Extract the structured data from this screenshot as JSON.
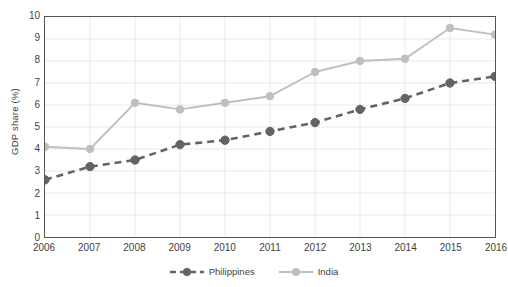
{
  "chart_data": {
    "type": "line",
    "title": "",
    "xlabel": "",
    "ylabel": "GDP share (%)",
    "categories": [
      "2006",
      "2007",
      "2008",
      "2009",
      "2010",
      "2011",
      "2012",
      "2013",
      "2014",
      "2015",
      "2016"
    ],
    "x": [
      2006,
      2007,
      2008,
      2009,
      2010,
      2011,
      2012,
      2013,
      2014,
      2015,
      2016
    ],
    "ylim": [
      0,
      10
    ],
    "yticks": [
      0,
      1,
      2,
      3,
      4,
      5,
      6,
      7,
      8,
      9,
      10
    ],
    "ytick_labels": [
      "0",
      "1",
      "2",
      "3",
      "4",
      "5",
      "6",
      "7",
      "8",
      "9",
      "10"
    ],
    "grid": true,
    "legend_position": "bottom",
    "series": [
      {
        "name": "Philippines",
        "values": [
          2.6,
          3.2,
          3.5,
          4.2,
          4.4,
          4.8,
          5.2,
          5.8,
          6.3,
          7.0,
          7.3
        ],
        "color": "#636363",
        "line_style": "dashed",
        "marker": "circle"
      },
      {
        "name": "India",
        "values": [
          4.1,
          4.0,
          6.1,
          5.8,
          6.1,
          6.4,
          7.5,
          8.0,
          8.1,
          9.5,
          9.2
        ],
        "color": "#bfbfbf",
        "line_style": "solid",
        "marker": "circle"
      }
    ]
  },
  "axis": {
    "y_title": "GDP share (%)"
  },
  "legend": {
    "items": [
      {
        "label": "Philippines"
      },
      {
        "label": "India"
      }
    ]
  },
  "colors": {
    "philippines": "#636363",
    "india": "#bfbfbf",
    "axis": "#555555",
    "grid": "#e9e9e9",
    "text": "#3f3f3f"
  }
}
